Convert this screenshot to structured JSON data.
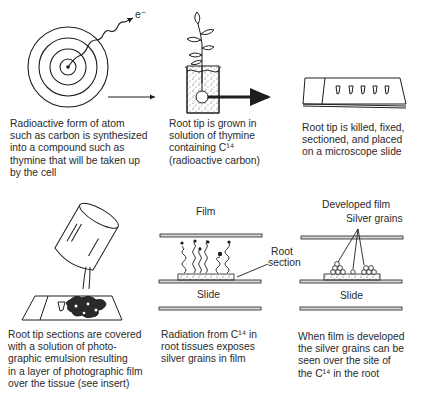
{
  "steps": [
    {
      "id": "atom",
      "caption_lines": [
        "Radioactive form of atom",
        "such as carbon is synthesized",
        "into a compound such as",
        "thymine that will be taken up",
        "by the cell"
      ],
      "labels": {
        "electron": "e⁻"
      }
    },
    {
      "id": "root-growth",
      "caption_lines": [
        "Root tip is grown in",
        "solution of thymine",
        "containing  C¹⁴",
        "(radioactive carbon)"
      ]
    },
    {
      "id": "slide-prep",
      "caption_lines": [
        "Root tip is killed, fixed,",
        "sectioned, and  placed",
        "on a microscope slide"
      ]
    },
    {
      "id": "emulsion",
      "caption_lines": [
        "Root tip sections are covered",
        "with a solution of photo-",
        "graphic emulsion resulting",
        "in a layer of photographic film",
        "over the tissue  (see insert)"
      ]
    },
    {
      "id": "exposure",
      "caption_lines": [
        "Radiation from C¹⁴ in",
        "root tissues exposes",
        "silver grains in film"
      ],
      "labels": {
        "film": "Film",
        "root_section_line1": "Root",
        "root_section_line2": "section",
        "slide": "Slide"
      }
    },
    {
      "id": "developed",
      "caption_lines": [
        "When film is developed",
        "the silver grains can be",
        "seen over the site of",
        "the C¹⁴ in the root"
      ],
      "labels": {
        "developed_film": "Developed film",
        "silver_grains": "Silver grains",
        "slide": "Slide"
      }
    }
  ],
  "colors": {
    "ink": "#1e1e1e",
    "paper": "#ffffff",
    "film_bar": "#d8d8d8"
  }
}
